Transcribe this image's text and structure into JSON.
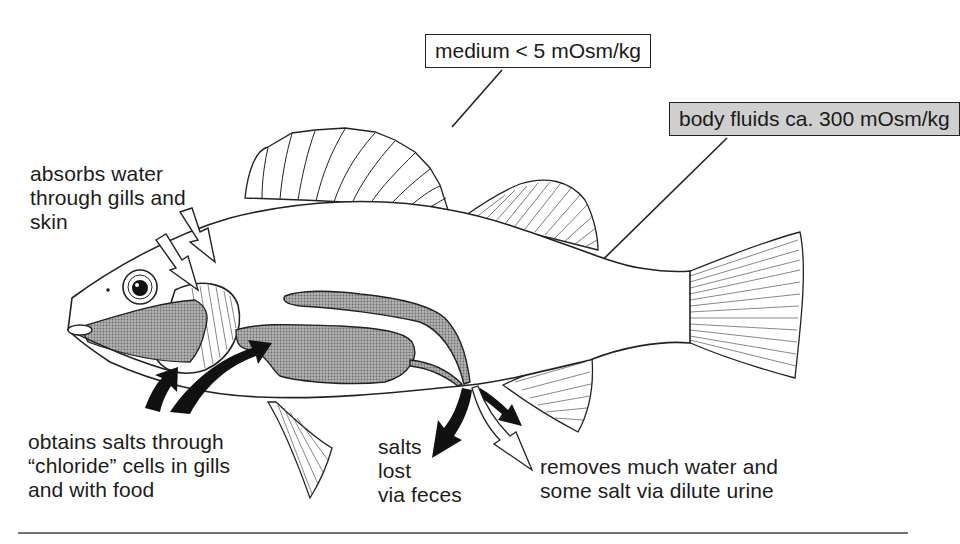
{
  "diagram": {
    "boxes": {
      "medium": "medium < 5 mOsm/kg",
      "body_fluids": "body fluids ca. 300 mOsm/kg"
    },
    "labels": {
      "water_in": "absorbs water\nthrough gills and\nskin",
      "salts_in": "obtains salts through\n“chloride” cells in gills\nand with food",
      "feces": "salts\nlost\nvia feces",
      "urine": "removes much water and\nsome salt via dilute urine"
    },
    "colors": {
      "ink": "#1a1a1a",
      "organ_fill": "#9a9a9a",
      "body_box_fill": "#cfcfcf",
      "background": "#ffffff"
    },
    "arrows": [
      {
        "name": "water-in",
        "style": "hollow",
        "count": 2,
        "direction": "into gills"
      },
      {
        "name": "salts-in",
        "style": "solid-black",
        "count": 2,
        "direction": "into gills/mouth"
      },
      {
        "name": "salts-out-feces",
        "style": "solid-black",
        "count": 1,
        "direction": "out of anus"
      },
      {
        "name": "urine-out",
        "style": "solid-black + hollow",
        "count": 2,
        "direction": "out of urogenital pore"
      }
    ]
  }
}
